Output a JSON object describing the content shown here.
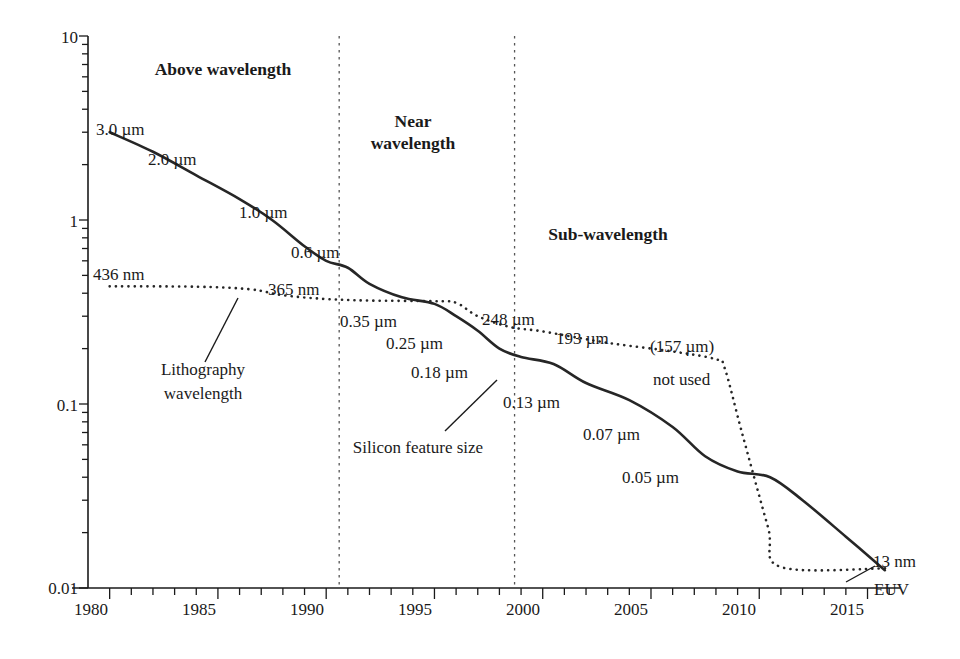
{
  "chart_data": {
    "type": "line",
    "title": "",
    "subtitle": "",
    "xlabel": "",
    "ylabel": "",
    "xlim": [
      1979.0,
      2016.5
    ],
    "ylim": [
      0.01,
      10
    ],
    "yscale": "log",
    "xscale": "linear",
    "grid": false,
    "legend_position": "inline-annotations",
    "x_ticks_major": [
      1980,
      1985,
      1990,
      1995,
      2000,
      2005,
      2010,
      2015
    ],
    "x_tick_labels": [
      "1980",
      "1985",
      "1990",
      "1995",
      "2000",
      "2005",
      "2010",
      "2015"
    ],
    "x_ticks_minor_step": 1,
    "y_ticks_major": [
      0.01,
      0.1,
      1,
      10
    ],
    "y_tick_labels": [
      "0.01",
      "0.1",
      "1",
      "10"
    ],
    "y_minor_decade_multiples": [
      2,
      3,
      4,
      5,
      6,
      7,
      8,
      9
    ],
    "series": [
      {
        "name": "Silicon feature size",
        "style": "solid",
        "unit": "micrometre",
        "points": [
          {
            "x": 1980.0,
            "y": 3.0
          },
          {
            "x": 1982.0,
            "y": 2.35
          },
          {
            "x": 1984.0,
            "y": 1.75
          },
          {
            "x": 1986.0,
            "y": 1.3
          },
          {
            "x": 1987.5,
            "y": 1.0
          },
          {
            "x": 1989.0,
            "y": 0.72
          },
          {
            "x": 1990.0,
            "y": 0.6
          },
          {
            "x": 1991.0,
            "y": 0.55
          },
          {
            "x": 1992.0,
            "y": 0.45
          },
          {
            "x": 1993.5,
            "y": 0.38
          },
          {
            "x": 1995.0,
            "y": 0.35
          },
          {
            "x": 1996.0,
            "y": 0.3
          },
          {
            "x": 1997.0,
            "y": 0.25
          },
          {
            "x": 1998.0,
            "y": 0.2
          },
          {
            "x": 1999.0,
            "y": 0.18
          },
          {
            "x": 2000.5,
            "y": 0.165
          },
          {
            "x": 2002.0,
            "y": 0.13
          },
          {
            "x": 2004.0,
            "y": 0.105
          },
          {
            "x": 2006.0,
            "y": 0.075
          },
          {
            "x": 2007.5,
            "y": 0.052
          },
          {
            "x": 2009.0,
            "y": 0.043
          },
          {
            "x": 2010.5,
            "y": 0.04
          },
          {
            "x": 2012.0,
            "y": 0.03
          },
          {
            "x": 2014.0,
            "y": 0.019
          },
          {
            "x": 2015.8,
            "y": 0.0125
          }
        ]
      },
      {
        "name": "Lithography wavelength",
        "style": "dotted",
        "unit": "micrometre",
        "points": [
          {
            "x": 1980.0,
            "y": 0.436
          },
          {
            "x": 1984.0,
            "y": 0.434
          },
          {
            "x": 1986.5,
            "y": 0.42
          },
          {
            "x": 1988.0,
            "y": 0.39
          },
          {
            "x": 1990.0,
            "y": 0.372
          },
          {
            "x": 1992.0,
            "y": 0.365
          },
          {
            "x": 1995.0,
            "y": 0.362
          },
          {
            "x": 1996.0,
            "y": 0.355
          },
          {
            "x": 1997.0,
            "y": 0.3
          },
          {
            "x": 1998.5,
            "y": 0.262
          },
          {
            "x": 2000.0,
            "y": 0.248
          },
          {
            "x": 2003.0,
            "y": 0.215
          },
          {
            "x": 2006.0,
            "y": 0.193
          },
          {
            "x": 2008.0,
            "y": 0.175
          },
          {
            "x": 2008.4,
            "y": 0.157
          },
          {
            "x": 2009.2,
            "y": 0.07
          },
          {
            "x": 2010.4,
            "y": 0.0215
          },
          {
            "x": 2011.0,
            "y": 0.013
          },
          {
            "x": 2015.9,
            "y": 0.0128
          }
        ]
      }
    ],
    "region_dividers_x": [
      1990.6,
      1998.7
    ],
    "regions": [
      {
        "label": "Above wavelength",
        "x_center": 1985.0
      },
      {
        "label": "Near wavelength",
        "x_center": 1994.6
      },
      {
        "label": "Sub-wavelength",
        "x_center": 2004.2
      }
    ],
    "point_labels": [
      {
        "text": "3.0 µm",
        "series": "Silicon feature size"
      },
      {
        "text": "2.0 µm",
        "series": "Silicon feature size"
      },
      {
        "text": "1.0 µm",
        "series": "Silicon feature size"
      },
      {
        "text": "0.6 µm",
        "series": "Silicon feature size"
      },
      {
        "text": "0.35 µm",
        "series": "Silicon feature size"
      },
      {
        "text": "0.25 µm",
        "series": "Silicon feature size"
      },
      {
        "text": "0.18 µm",
        "series": "Silicon feature size"
      },
      {
        "text": "0.13 µm",
        "series": "Silicon feature size"
      },
      {
        "text": "0.07 µm",
        "series": "Silicon feature size"
      },
      {
        "text": "0.05 µm",
        "series": "Silicon feature size"
      },
      {
        "text": "436 nm",
        "series": "Lithography wavelength"
      },
      {
        "text": "365 nm",
        "series": "Lithography wavelength"
      },
      {
        "text": "248 µm",
        "series": "Lithography wavelength"
      },
      {
        "text": "193 µm",
        "series": "Lithography wavelength"
      },
      {
        "text": "(157 µm)",
        "series": "Lithography wavelength"
      },
      {
        "text": "not used",
        "series": "Lithography wavelength"
      },
      {
        "text": "13 nm",
        "series": "Lithography wavelength"
      },
      {
        "text": "EUV",
        "series": "Lithography wavelength"
      }
    ]
  },
  "axis": {
    "y_labels": [
      "10",
      "1",
      "0.1",
      "0.01"
    ],
    "x_labels": [
      "1980",
      "1985",
      "1990",
      "1995",
      "2000",
      "2005",
      "2010",
      "2015"
    ]
  },
  "regions": {
    "above": "Above wavelength",
    "near_line1": "Near",
    "near_line2": "wavelength",
    "sub": "Sub-wavelength"
  },
  "labels": {
    "p30": "3.0 µm",
    "p20": "2.0 µm",
    "p10": "1.0 µm",
    "p06": "0.6 µm",
    "p035": "0.35 µm",
    "p025": "0.25 µm",
    "p018": "0.18 µm",
    "p013": "0.13 µm",
    "p007": "0.07 µm",
    "p005": "0.05 µm",
    "w436": "436 nm",
    "w365": "365 nm",
    "w248": "248 µm",
    "w193": "193 µm",
    "w157": "(157 µm)",
    "not_used": "not used",
    "w13": "13 nm",
    "euv": "EUV"
  },
  "annotations": {
    "litho_line1": "Lithography",
    "litho_line2": "wavelength",
    "silicon": "Silicon feature size"
  },
  "colors": {
    "ink": "#1a1a1a",
    "background": "#ffffff",
    "curve": "#262626",
    "divider": "#555555"
  }
}
